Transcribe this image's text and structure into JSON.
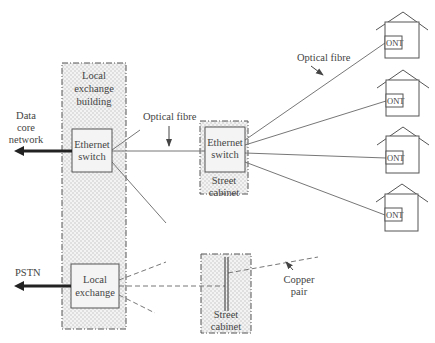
{
  "diagram": {
    "type": "network-architecture",
    "colors": {
      "line": "#777777",
      "box": "#555555",
      "text": "#444444",
      "shade": "#e6e6e6",
      "arrow": "#222222"
    }
  },
  "labels": {
    "building": [
      "Local",
      "exchange",
      "building"
    ],
    "data_core": [
      "Data",
      "core",
      "network"
    ],
    "pstn": "PSTN",
    "eth_switch_left": [
      "Ethernet",
      "switch"
    ],
    "eth_switch_cabinet": [
      "Ethernet",
      "switch"
    ],
    "local_exchange": [
      "Local",
      "exchange"
    ],
    "street_cabinet_1": [
      "Street",
      "cabinet"
    ],
    "street_cabinet_2": [
      "Street",
      "cabinet"
    ],
    "optical_fibre_1": "Optical fibre",
    "optical_fibre_2": "Optical fibre",
    "copper_pair": [
      "Copper",
      "pair"
    ],
    "ont": [
      "ONT",
      "ONT",
      "ONT",
      "ONT"
    ]
  }
}
